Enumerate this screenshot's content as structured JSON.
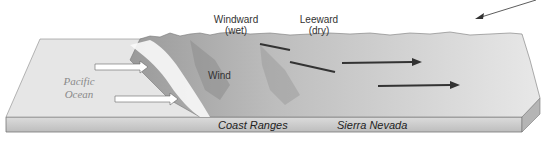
{
  "diagram": {
    "labels": {
      "windward": "Windward",
      "windward_sub": "(wet)",
      "leeward": "Leeward",
      "leeward_sub": "(dry)",
      "wind": "Wind",
      "ocean_line1": "Pacific",
      "ocean_line2": "Ocean",
      "coast_ranges": "Coast Ranges",
      "sierra_nevada": "Sierra Nevada"
    },
    "colors": {
      "ocean_surface": "#e4e4e4",
      "slab_side": "#cfcfcf",
      "terrain_light": "#f2f2f2",
      "terrain_dark": "#8a8a8a",
      "wind_arrow_dark": "#3a3a3a",
      "wind_arrow_light": "#ffffff"
    }
  }
}
